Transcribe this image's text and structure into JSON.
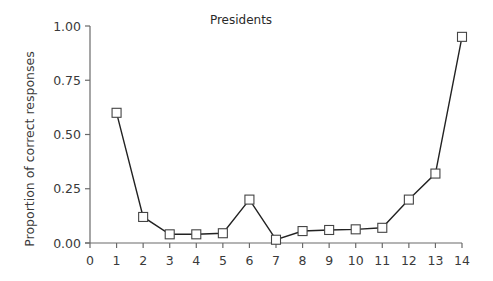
{
  "chart_data": {
    "type": "line",
    "title": "Presidents",
    "xlabel": "",
    "ylabel": "Proportion of correct responses",
    "x": [
      1,
      2,
      3,
      4,
      5,
      6,
      7,
      8,
      9,
      10,
      11,
      12,
      13,
      14
    ],
    "series": [
      {
        "name": "Presidents",
        "values": [
          0.6,
          0.12,
          0.04,
          0.04,
          0.045,
          0.2,
          0.015,
          0.055,
          0.06,
          0.063,
          0.07,
          0.2,
          0.32,
          0.95
        ],
        "marker": "open-square",
        "color": "#222222"
      }
    ],
    "xlim": [
      0,
      14
    ],
    "ylim": [
      0,
      1.0
    ],
    "xticks": [
      0,
      1,
      2,
      3,
      4,
      5,
      6,
      7,
      8,
      9,
      10,
      11,
      12,
      13,
      14
    ],
    "xtick_labels": [
      "0",
      "1",
      "2",
      "3",
      "4",
      "5",
      "6",
      "7",
      "8",
      "9",
      "10",
      "11",
      "12",
      "13",
      "14"
    ],
    "yticks": [
      0,
      0.25,
      0.5,
      0.75,
      1.0
    ],
    "ytick_labels": [
      "0.00",
      "0.25",
      "0.50",
      "0.75",
      "1.00"
    ],
    "grid": false,
    "legend": null
  }
}
